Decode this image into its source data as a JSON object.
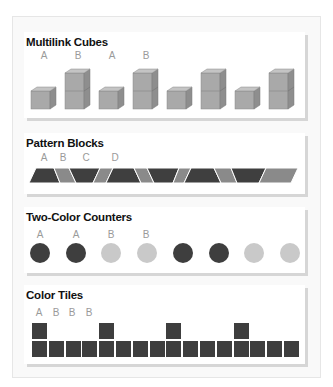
{
  "colors": {
    "dark": "#3e3e3e",
    "light": "#c9c9c9",
    "cube_front": "#a9a9a9",
    "cube_top": "#c4c4c4",
    "cube_side": "#8e8e8e",
    "pattern_dark": "#3f3f3f",
    "pattern_mid": "#8a8a8a",
    "label": "#9a9a9a"
  },
  "sections": [
    {
      "title": "Multilink Cubes",
      "labels": [
        "A",
        "B",
        "A",
        "B"
      ],
      "sequence": [
        1,
        2,
        1,
        2,
        1,
        2,
        1,
        2
      ]
    },
    {
      "title": "Pattern Blocks",
      "labels": [
        "A",
        "B",
        "C",
        "D"
      ],
      "sequence": [
        "dark-trapezoid",
        "gray-rhombus",
        "dark-trapezoid-inverted",
        "gray-rhombus",
        "dark-trapezoid",
        "gray-rhombus",
        "dark-trapezoid-inverted",
        "gray-rhombus",
        "dark-trapezoid",
        "gray-rhombus",
        "dark-trapezoid-inverted",
        "gray-rhombus"
      ]
    },
    {
      "title": "Two-Color Counters",
      "labels": [
        "A",
        "A",
        "B",
        "B"
      ],
      "sequence": [
        "dark",
        "dark",
        "light",
        "light",
        "dark",
        "dark",
        "light",
        "light"
      ]
    },
    {
      "title": "Color Tiles",
      "labels": [
        "A",
        "B",
        "B",
        "B"
      ],
      "sequence": [
        2,
        1,
        1,
        1,
        2,
        1,
        1,
        1,
        2,
        1,
        1,
        1,
        2,
        1,
        1,
        1
      ]
    }
  ]
}
